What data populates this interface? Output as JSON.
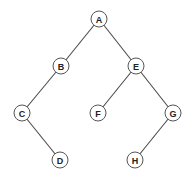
{
  "diagram": {
    "type": "binary-tree",
    "colors": {
      "background": "#ffffff",
      "edge": "#4a4a4a",
      "node_stroke": "#555555",
      "node_fill": "#ffffff",
      "label": "#222222"
    },
    "node_radius": 8,
    "nodes": [
      {
        "id": "A",
        "label": "A",
        "x": 99,
        "y": 19
      },
      {
        "id": "B",
        "label": "B",
        "x": 61,
        "y": 66
      },
      {
        "id": "E",
        "label": "E",
        "x": 136,
        "y": 66
      },
      {
        "id": "C",
        "label": "C",
        "x": 22,
        "y": 113
      },
      {
        "id": "F",
        "label": "F",
        "x": 98,
        "y": 113
      },
      {
        "id": "G",
        "label": "G",
        "x": 173,
        "y": 113
      },
      {
        "id": "D",
        "label": "D",
        "x": 60,
        "y": 160
      },
      {
        "id": "H",
        "label": "H",
        "x": 135,
        "y": 160
      }
    ],
    "edges": [
      {
        "from": "A",
        "to": "B"
      },
      {
        "from": "A",
        "to": "E"
      },
      {
        "from": "B",
        "to": "C"
      },
      {
        "from": "C",
        "to": "D"
      },
      {
        "from": "E",
        "to": "F"
      },
      {
        "from": "E",
        "to": "G"
      },
      {
        "from": "G",
        "to": "H"
      }
    ]
  }
}
